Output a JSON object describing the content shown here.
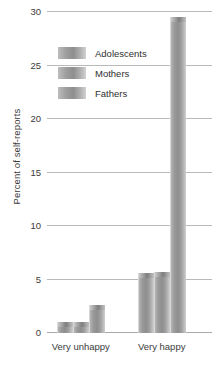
{
  "chart_data": {
    "type": "bar",
    "title": "",
    "subtitle": "",
    "xlabel": "",
    "ylabel": "Percent of self-reports",
    "categories": [
      "Very unhappy",
      "Very happy"
    ],
    "series": [
      {
        "name": "Adolescents",
        "values": [
          1.0,
          5.6
        ],
        "color": "#9a9a9a"
      },
      {
        "name": "Mothers",
        "values": [
          1.0,
          5.7
        ],
        "color": "#9a9a9a"
      },
      {
        "name": "Fathers",
        "values": [
          2.6,
          29.5
        ],
        "color": "#9a9a9a"
      }
    ],
    "ylim": [
      0,
      30
    ],
    "yticks": [
      0,
      5,
      10,
      15,
      20,
      25,
      30
    ],
    "ytick_labels": [
      "0",
      "5",
      "10",
      "15",
      "20",
      "25",
      "30"
    ],
    "grid": true,
    "legend_position": "upper-left-inside",
    "legend_entries": [
      "Adolescents",
      "Mothers",
      "Fathers"
    ],
    "annotations": []
  },
  "axis": {
    "y_title": "Percent of self-reports"
  },
  "legend": {
    "items": [
      {
        "label": "Adolescents"
      },
      {
        "label": "Mothers"
      },
      {
        "label": "Fathers"
      }
    ]
  },
  "x_axis": {
    "labels": [
      "Very unhappy",
      "Very happy"
    ]
  }
}
